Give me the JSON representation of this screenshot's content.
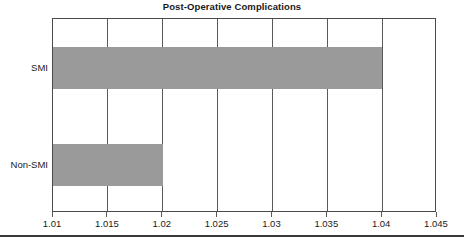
{
  "chart_data": {
    "type": "bar",
    "orientation": "horizontal",
    "title": "Post-Operative Complications",
    "xlabel": "",
    "ylabel": "",
    "categories": [
      "SMI",
      "Non-SMI"
    ],
    "values": [
      1.04,
      1.02
    ],
    "series": [
      {
        "name": "Post-Operative Complications",
        "values": [
          1.04,
          1.02
        ]
      }
    ],
    "xlim": [
      1.01,
      1.045
    ],
    "xticks": [
      1.01,
      1.015,
      1.02,
      1.025,
      1.03,
      1.035,
      1.04,
      1.045
    ],
    "xtick_labels": [
      "1.01",
      "1.015",
      "1.02",
      "1.025",
      "1.03",
      "1.035",
      "1.04",
      "1.045"
    ],
    "grid": true,
    "grid_axis": "x",
    "legend": false,
    "legend_position": "none",
    "bar_color": "#9a9a9a",
    "axis_color": "#4a4a4a",
    "background_color": "#ffffff",
    "text_color": "#1a1a1a"
  },
  "footer": {
    "rule_color": "#3a3a3a"
  }
}
